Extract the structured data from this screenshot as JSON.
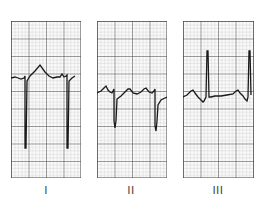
{
  "figure": {
    "type": "ECG limb lead strips",
    "panels": [
      {
        "label": "I",
        "description": "Lead I: deep negative QRS deflections with peaked T wave"
      },
      {
        "label": "II",
        "description": "Lead II: moderate negative QRS deflections"
      },
      {
        "label": "III",
        "description": "Lead III: tall positive R waves"
      }
    ]
  },
  "colors": {
    "trace": "#1a1a1a",
    "grid_minor": "#9a9a9a",
    "grid_major": "#3a3a3a",
    "paper": "#fbfbfb"
  }
}
